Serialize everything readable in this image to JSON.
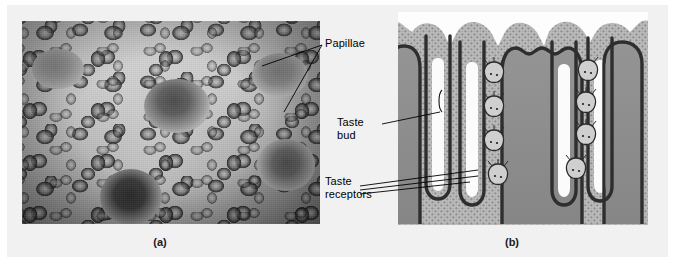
{
  "figure": {
    "background_color": "#f1f1f1",
    "page_color": "#ffffff",
    "width": 675,
    "height": 267
  },
  "panels": [
    {
      "id": "a",
      "caption": "(a)",
      "type": "scanning-electron-micrograph",
      "subject": "surface of the tongue showing papillae",
      "palette": {
        "dark": "#1f1f1f",
        "mid": "#6a6a6a",
        "light": "#cfcfcf"
      }
    },
    {
      "id": "b",
      "caption": "(b)",
      "type": "schematic-cross-section",
      "subject": "cross-section of a papilla with taste buds in the trenches",
      "palette": {
        "background": "#fdfdfd",
        "epithelium_stipple": "#b5b5b5",
        "epithelium_dot": "#6f6f6f",
        "connective_core": "#8e8e8e",
        "membrane_outline": "#3c3c3c",
        "trench_lumen": "#f6f6f6",
        "taste_bud_fill": "#c9c9c9",
        "taste_bud_outline": "#2f2f2f"
      }
    }
  ],
  "labels": [
    {
      "id": "papillae",
      "text": "Papillae",
      "lines": 1
    },
    {
      "id": "taste-bud",
      "text": "Taste\nbud",
      "lines": 2
    },
    {
      "id": "taste-receptors",
      "text": "Taste\nreceptors",
      "lines": 2
    }
  ],
  "leader_lines": {
    "color": "#000000",
    "width": 0.9,
    "papillae_count": 2,
    "taste_bud_count": 1,
    "taste_receptors_count": 3
  },
  "captions": {
    "a": "(a)",
    "b": "(b)"
  }
}
